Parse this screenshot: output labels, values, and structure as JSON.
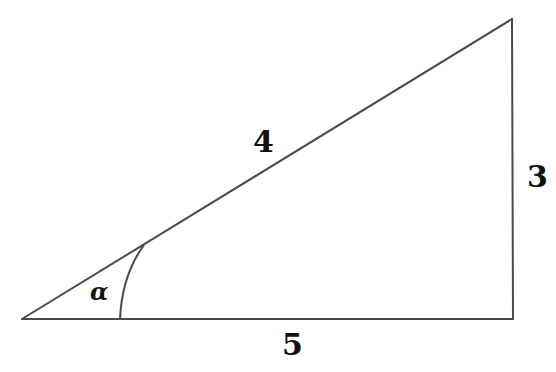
{
  "diagram": {
    "type": "right-triangle",
    "labels": {
      "hypotenuse": "4",
      "vertical_side": "3",
      "base": "5",
      "angle": "α"
    },
    "colors": {
      "stroke": "#4a4a4a",
      "text": "#111111",
      "background": "#ffffff"
    }
  }
}
